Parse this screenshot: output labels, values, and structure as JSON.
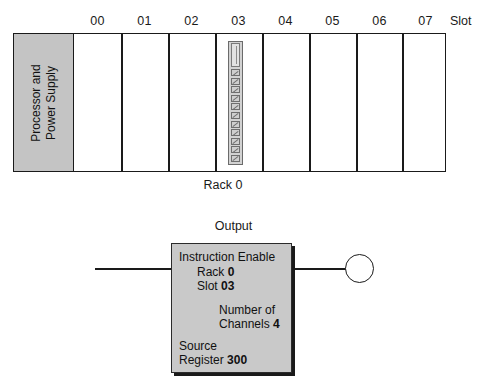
{
  "rack": {
    "slot_axis_label": "Slot",
    "slot_labels": [
      "00",
      "01",
      "02",
      "03",
      "04",
      "05",
      "06",
      "07"
    ],
    "psu_line_1": "Processor and",
    "psu_line_2": "Power Supply",
    "caption": "Rack 0",
    "module_slot": "03",
    "module_terminal_count": 11,
    "colors": {
      "psu_fill": "#c4c4c4",
      "outline": "#1a1a1a",
      "module_fill": "#d2d2d2"
    }
  },
  "rung": {
    "output_caption": "Output",
    "instruction": {
      "title": "Instruction Enable",
      "rack_label": "Rack",
      "rack_value": "0",
      "slot_label": "Slot",
      "slot_value": "03",
      "channels_label_1": "Number of",
      "channels_label_2": "Channels",
      "channels_value": "4",
      "source_label": "Source",
      "register_label": "Register",
      "register_value": "300"
    },
    "coil": "output-coil"
  }
}
